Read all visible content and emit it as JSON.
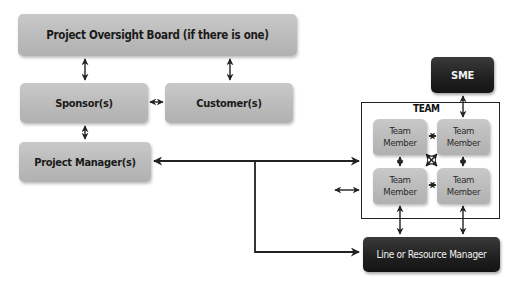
{
  "diagram": {
    "nodes": {
      "oversight_board": "Project Oversight Board (if there is one)",
      "sponsor": "Sponsor(s)",
      "customer": "Customer(s)",
      "project_manager": "Project Manager(s)",
      "sme": "SME",
      "team_label": "TEAM",
      "team_member_1": "Team Member",
      "team_member_2": "Team Member",
      "team_member_3": "Team Member",
      "team_member_4": "Team Member",
      "line_manager": "Line or Resource Manager"
    },
    "edges": [
      {
        "from": "oversight_board",
        "to": "sponsor",
        "type": "bidirectional"
      },
      {
        "from": "oversight_board",
        "to": "customer",
        "type": "bidirectional"
      },
      {
        "from": "sponsor",
        "to": "customer",
        "type": "bidirectional"
      },
      {
        "from": "sponsor",
        "to": "project_manager",
        "type": "bidirectional"
      },
      {
        "from": "project_manager",
        "to": "team",
        "type": "bidirectional"
      },
      {
        "from": "project_manager",
        "to": "line_manager",
        "type": "directed"
      },
      {
        "from": "external",
        "to": "team",
        "type": "bidirectional"
      },
      {
        "from": "sme",
        "to": "team_member_2",
        "type": "bidirectional"
      },
      {
        "from": "team_member_1",
        "to": "team_member_2",
        "type": "bidirectional"
      },
      {
        "from": "team_member_3",
        "to": "team_member_4",
        "type": "bidirectional"
      },
      {
        "from": "team_member_1",
        "to": "team_member_3",
        "type": "bidirectional"
      },
      {
        "from": "team_member_2",
        "to": "team_member_4",
        "type": "bidirectional"
      },
      {
        "from": "team_member_1",
        "to": "team_member_4",
        "type": "cross"
      },
      {
        "from": "team_member_3",
        "to": "line_manager",
        "type": "bidirectional"
      },
      {
        "from": "team_member_4",
        "to": "line_manager",
        "type": "bidirectional"
      }
    ],
    "colors": {
      "node_grey": "#bdbdbd",
      "node_dark": "#1f1f1f",
      "line": "#222222"
    }
  }
}
